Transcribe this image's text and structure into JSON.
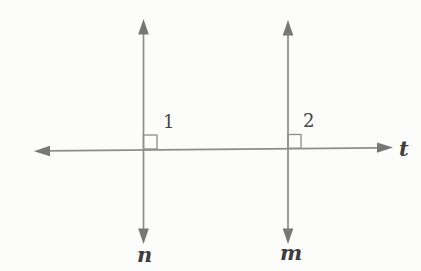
{
  "figure": {
    "background_color": "#fcfcfb",
    "line_color": "#8d8d8d",
    "arrow_color": "#767676",
    "label_color": "#3e3e3e",
    "labels": {
      "transversal": "t",
      "left_vertical": "n",
      "right_vertical": "m"
    },
    "angles": {
      "left": "1",
      "right": "2",
      "mark_type": "right-angle-square"
    }
  }
}
